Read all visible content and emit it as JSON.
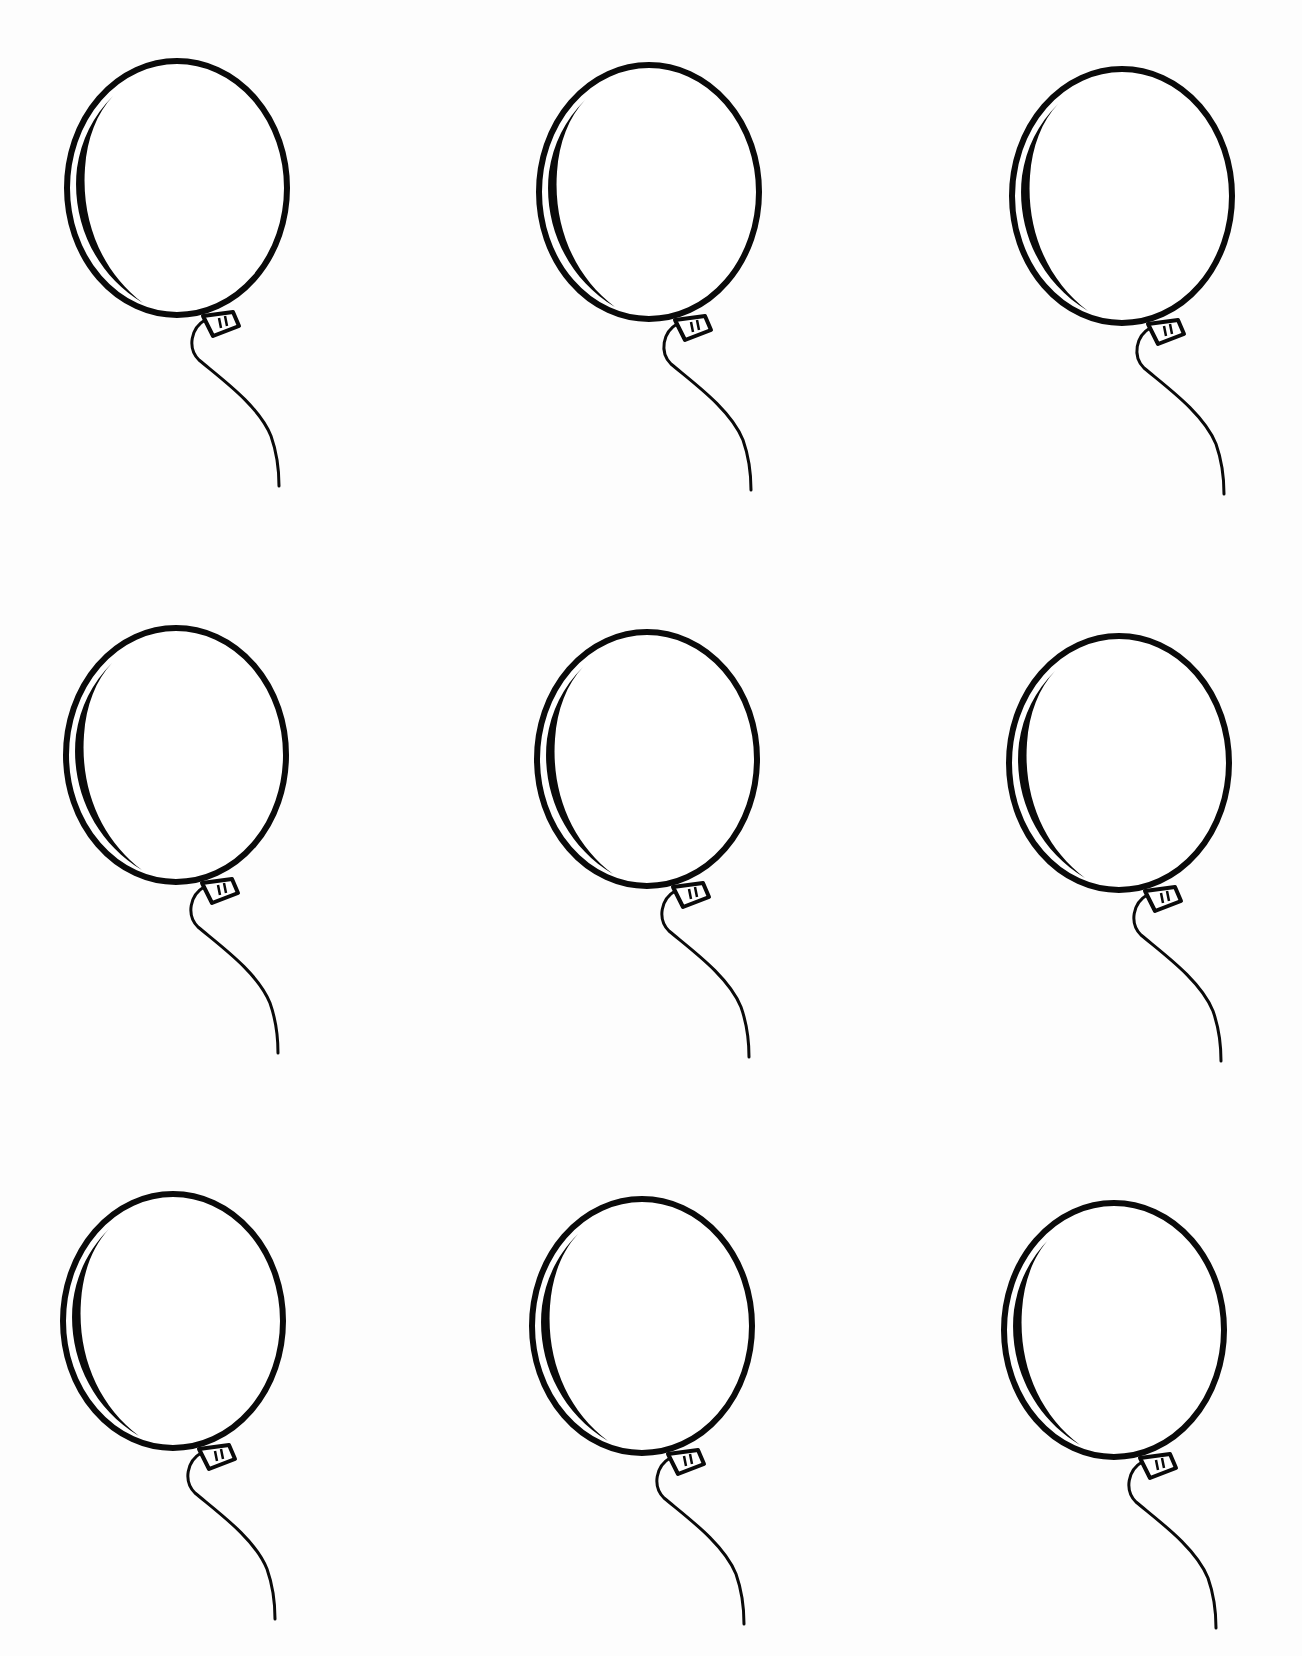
{
  "page": {
    "background": "#fdfdfd",
    "ink_color": "#0a0a0a",
    "width": 1302,
    "height": 1656
  },
  "balloons": [
    {
      "row": 1,
      "col": 1,
      "x": 63,
      "y": 58
    },
    {
      "row": 1,
      "col": 2,
      "x": 535,
      "y": 62
    },
    {
      "row": 1,
      "col": 3,
      "x": 1008,
      "y": 66
    },
    {
      "row": 2,
      "col": 1,
      "x": 62,
      "y": 625
    },
    {
      "row": 2,
      "col": 2,
      "x": 533,
      "y": 629
    },
    {
      "row": 2,
      "col": 3,
      "x": 1005,
      "y": 633
    },
    {
      "row": 3,
      "col": 1,
      "x": 59,
      "y": 1191
    },
    {
      "row": 3,
      "col": 2,
      "x": 528,
      "y": 1196
    },
    {
      "row": 3,
      "col": 3,
      "x": 1000,
      "y": 1200
    }
  ]
}
